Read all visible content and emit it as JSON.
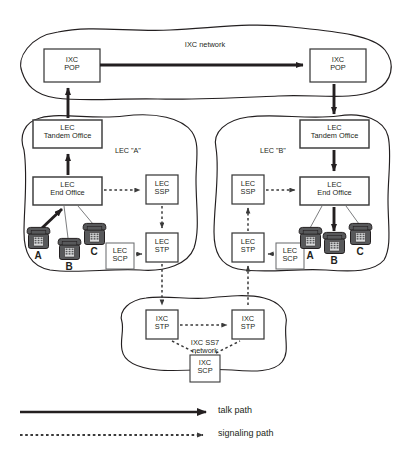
{
  "diagram": {
    "colors": {
      "ink": "#231f20",
      "box_stroke": "#3a3a3a",
      "cloud_stroke": "#231f20",
      "thin_line": "#6d6e71",
      "phone_fill": "#58595b",
      "background": "#ffffff"
    }
  },
  "clouds": {
    "ixc_network": {
      "label": "IXC network"
    },
    "lec_a": {
      "label": "LEC \"A\""
    },
    "lec_b": {
      "label": "LEC \"B\""
    },
    "ixc_ss7": {
      "label_line1": "IXC SS7",
      "label_line2": "network"
    }
  },
  "nodes": {
    "ixc_pop_left": {
      "line1": "IXC",
      "line2": "POP"
    },
    "ixc_pop_right": {
      "line1": "IXC",
      "line2": "POP"
    },
    "lec_a_tandem": {
      "line1": "LEC",
      "line2": "Tandem Office"
    },
    "lec_a_end": {
      "line1": "LEC",
      "line2": "End Office"
    },
    "lec_a_ssp": {
      "line1": "LEC",
      "line2": "SSP"
    },
    "lec_a_stp": {
      "line1": "LEC",
      "line2": "STP"
    },
    "lec_a_scp": {
      "line1": "LEC",
      "line2": "SCP"
    },
    "lec_b_tandem": {
      "line1": "LEC",
      "line2": "Tandem Office"
    },
    "lec_b_end": {
      "line1": "LEC",
      "line2": "End Office"
    },
    "lec_b_ssp": {
      "line1": "LEC",
      "line2": "SSP"
    },
    "lec_b_stp": {
      "line1": "LEC",
      "line2": "STP"
    },
    "lec_b_scp": {
      "line1": "LEC",
      "line2": "SCP"
    },
    "ixc_stp_left": {
      "line1": "IXC",
      "line2": "STP"
    },
    "ixc_stp_right": {
      "line1": "IXC",
      "line2": "STP"
    },
    "ixc_scp": {
      "line1": "IXC",
      "line2": "SCP"
    }
  },
  "phones": {
    "lec_a": [
      {
        "id": "a",
        "label": "A"
      },
      {
        "id": "b",
        "label": "B"
      },
      {
        "id": "c",
        "label": "C"
      }
    ],
    "lec_b": [
      {
        "id": "a",
        "label": "A"
      },
      {
        "id": "b",
        "label": "B"
      },
      {
        "id": "c",
        "label": "C"
      }
    ]
  },
  "legend": {
    "talk": {
      "label": "talk path",
      "style": "solid"
    },
    "signaling": {
      "label": "signaling path",
      "style": "dotted"
    }
  }
}
